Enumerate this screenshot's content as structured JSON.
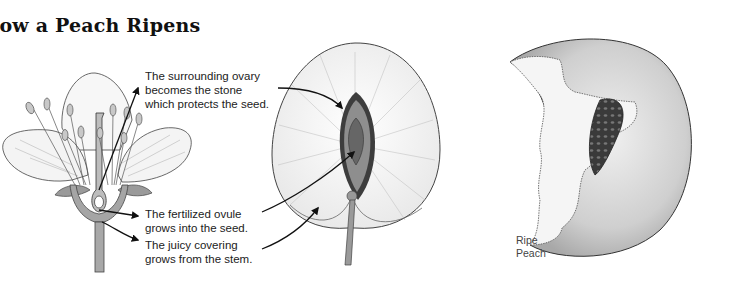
{
  "title_visible": "low a Peach Ripens",
  "panels": [
    {
      "id": "flower",
      "description": "Cross-section of a peach blossom"
    },
    {
      "id": "young-fruit",
      "description": "Cross-section of developing peach"
    },
    {
      "id": "ripe-peach",
      "description": "Ripe peach with bitten-away flesh revealing stone"
    }
  ],
  "labels": {
    "ovary": [
      "The surrounding ovary",
      "becomes the stone",
      "which protects the seed."
    ],
    "ovule": [
      "The fertilized ovule",
      "grows into the seed."
    ],
    "covering": [
      "The juicy covering",
      "grows from the stem."
    ],
    "ripe": [
      "Ripe",
      "Peach"
    ]
  },
  "colors": {
    "ink": "#1a1a1a",
    "light_fill": "#f2f2f2",
    "mid_gray": "#9a9a9a",
    "dark_gray": "#555555",
    "peach_skin": "#d4d4d4"
  }
}
